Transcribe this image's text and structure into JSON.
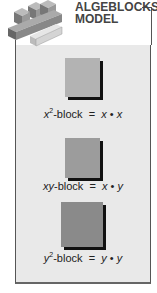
{
  "title": {
    "line1": "ALGEBLOCKS",
    "line2": "MODEL"
  },
  "blocks": [
    {
      "name": "x2",
      "var": "x",
      "sup": "2",
      "suffix": "-block",
      "eq": "=",
      "a": "x",
      "dot": "•",
      "b": "x",
      "color": "#b3b3b3"
    },
    {
      "name": "xy",
      "var": "xy",
      "sup": "",
      "suffix": "-block",
      "eq": "=",
      "a": "x",
      "dot": "•",
      "b": "y",
      "color": "#9c9c9c"
    },
    {
      "name": "y2",
      "var": "y",
      "sup": "2",
      "suffix": "-block",
      "eq": "=",
      "a": "y",
      "dot": "•",
      "b": "y",
      "color": "#8a8a8a"
    }
  ]
}
